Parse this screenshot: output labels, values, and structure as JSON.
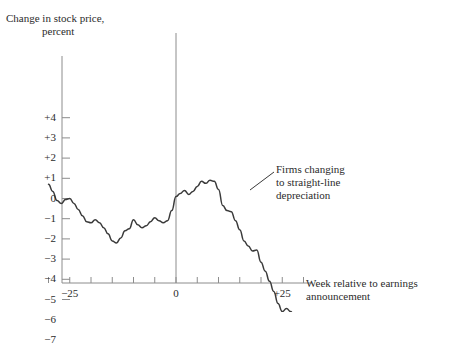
{
  "figure": {
    "background_color": "#ffffff",
    "ink_color": "#3a3a3a",
    "axis_color": "#8c8c8c"
  },
  "titles": {
    "y_title_line1": "Change in stock price,",
    "y_title_line2": "percent",
    "x_title_line1": "Week relative to earnings",
    "x_title_line2": "announcement"
  },
  "annotation": {
    "line1": "Firms changing",
    "line2": "to straight-line",
    "line3": "depreciation"
  },
  "chart_data": {
    "type": "line",
    "title": "Change in stock price, percent",
    "xlabel": "Week relative to earnings announcement",
    "ylabel": "Change in stock price, percent",
    "xlim": [
      -31,
      34
    ],
    "ylim": [
      -7,
      4.5
    ],
    "grid": false,
    "legend": null,
    "annotations": [
      {
        "text": "Firms changing to straight-line depreciation",
        "x": 22,
        "y": -2.6,
        "leader_line": true
      }
    ],
    "yticks": [
      4,
      3,
      2,
      1,
      0,
      -1,
      -2,
      -3,
      -4,
      -5,
      -6,
      -7
    ],
    "ytick_labels": [
      "+4",
      "+3",
      "+2",
      "+1",
      "0",
      "−1",
      "−2",
      "−3",
      "−4",
      "−5",
      "−6",
      "−7"
    ],
    "xticks": [
      -30,
      -25,
      -20,
      -15,
      -10,
      -5,
      0,
      5,
      10,
      15,
      20,
      25,
      30
    ],
    "xtick_labels_shown": [
      {
        "x": -25,
        "label": "−25"
      },
      {
        "x": 0,
        "label": "0"
      },
      {
        "x": 25,
        "label": "+25"
      }
    ],
    "reference_lines": [
      {
        "orientation": "vertical",
        "x": 0,
        "label": "earnings announcement week"
      }
    ],
    "series": [
      {
        "name": "Firms changing to straight-line depreciation",
        "x": [
          -30,
          -29,
          -28,
          -27,
          -26,
          -25,
          -24,
          -23,
          -22,
          -21,
          -20,
          -19,
          -18,
          -17,
          -16,
          -15,
          -14,
          -13,
          -12,
          -11,
          -10,
          -9,
          -8,
          -7,
          -6,
          -5,
          -4,
          -3,
          -2,
          -1,
          0,
          1,
          2,
          3,
          4,
          5,
          6,
          7,
          8,
          9,
          10,
          11,
          12,
          13,
          14,
          15,
          16,
          17,
          18,
          19,
          20,
          21,
          22,
          23,
          24,
          25,
          26,
          27,
          28,
          29,
          30,
          31
        ],
        "values": [
          0.7,
          0.35,
          -0.1,
          -0.25,
          -0.05,
          0.0,
          -0.25,
          -0.55,
          -0.85,
          -1.15,
          -1.2,
          -1.05,
          -1.2,
          -1.45,
          -1.75,
          -2.1,
          -2.2,
          -1.95,
          -1.6,
          -1.5,
          -1.05,
          -1.3,
          -1.45,
          -1.35,
          -1.15,
          -0.95,
          -1.1,
          -1.2,
          -1.1,
          -0.6,
          0.1,
          0.25,
          0.4,
          0.2,
          0.35,
          0.6,
          0.85,
          0.75,
          0.9,
          0.85,
          0.45,
          -0.35,
          -0.6,
          -0.65,
          -1.1,
          -1.55,
          -2.1,
          -2.35,
          -2.6,
          -2.55,
          -3.15,
          -3.6,
          -4.1,
          -4.6,
          -5.2,
          -5.6,
          -5.45,
          -5.6,
          -5.95,
          -6.15,
          -6.35,
          -6.25
        ]
      }
    ]
  }
}
